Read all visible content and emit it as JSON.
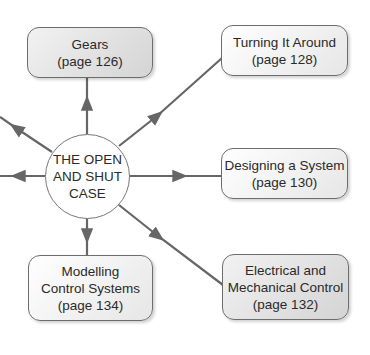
{
  "diagram": {
    "type": "concept-map",
    "center": {
      "lines": [
        "THE OPEN",
        "AND SHUT",
        "CASE"
      ]
    },
    "nodes": [
      {
        "id": "gears",
        "lines": [
          "Gears",
          "(page 126)"
        ],
        "shade": "dark"
      },
      {
        "id": "turning",
        "lines": [
          "Turning It Around",
          "(page 128)"
        ],
        "shade": "light"
      },
      {
        "id": "designing",
        "lines": [
          "Designing a System",
          "(page 130)"
        ],
        "shade": "light"
      },
      {
        "id": "modelling",
        "lines": [
          "Modelling",
          "Control Systems",
          "(page 134)"
        ],
        "shade": "light"
      },
      {
        "id": "electrical",
        "lines": [
          "Electrical and",
          "Mechanical Control",
          "(page 132)"
        ],
        "shade": "dark"
      }
    ],
    "colors": {
      "line": "#666666",
      "border": "#6d6d6d",
      "text": "#2a2a2a"
    }
  }
}
